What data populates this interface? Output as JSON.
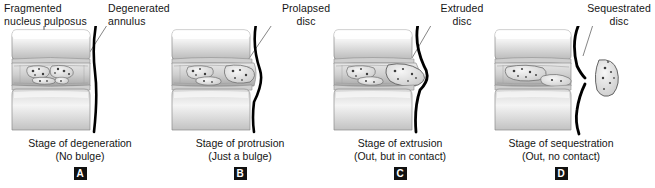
{
  "figure": {
    "background": "#ffffff",
    "ink": "#111111"
  },
  "panels": [
    {
      "id": "panel-a",
      "letter": "A",
      "callouts": [
        {
          "name": "fragmented-nucleus-pulposus-label",
          "text": "Fragmented\nnucleus pulposus"
        },
        {
          "name": "degenerated-annulus-label",
          "text": "Degenerated\nannulus"
        }
      ],
      "callout_primary_line1": "Fragmented",
      "callout_primary_line2": "nucleus pulposus",
      "callout_secondary_line1": "Degenerated",
      "callout_secondary_line2": "annulus",
      "caption_main": "Stage of degeneration",
      "caption_sub": "(No bulge)"
    },
    {
      "id": "panel-b",
      "letter": "B",
      "callout_primary_line1": "Prolapsed",
      "callout_primary_line2": "disc",
      "caption_main": "Stage of protrusion",
      "caption_sub": "(Just a bulge)"
    },
    {
      "id": "panel-c",
      "letter": "C",
      "callout_primary_line1": "Extruded",
      "callout_primary_line2": "disc",
      "caption_main": "Stage of extrusion",
      "caption_sub": "(Out, but in contact)"
    },
    {
      "id": "panel-d",
      "letter": "D",
      "callout_primary_line1": "Sequestrated",
      "callout_primary_line2": "disc",
      "caption_main": "Stage of sequestration",
      "caption_sub": "(Out, no contact)"
    }
  ]
}
